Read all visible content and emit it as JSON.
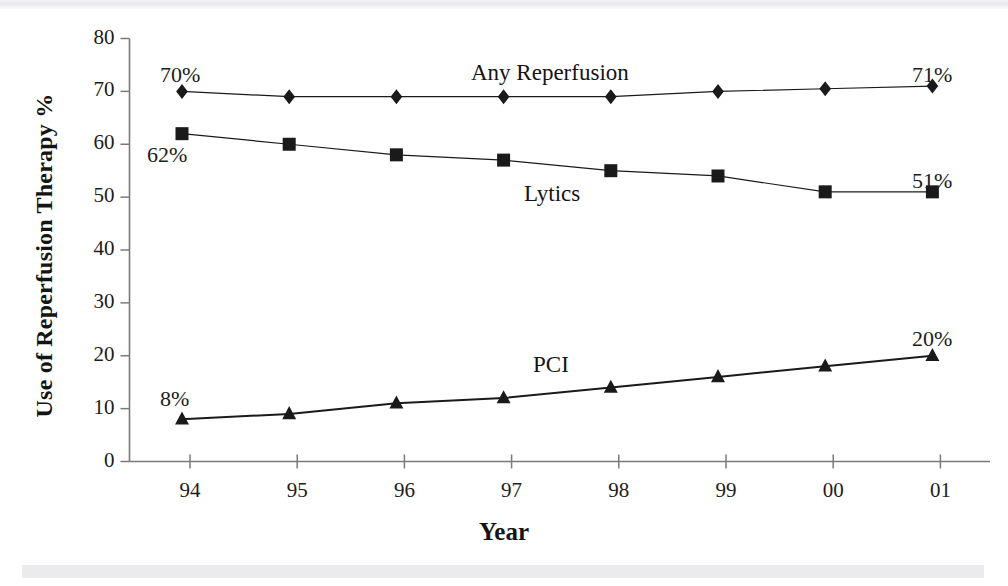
{
  "chart_data": {
    "type": "line",
    "title": "",
    "xlabel": "Year",
    "ylabel": "Use of Reperfusion Therapy %",
    "categories": [
      "94",
      "95",
      "96",
      "97",
      "98",
      "99",
      "00",
      "01"
    ],
    "ylim": [
      0,
      80
    ],
    "xlim_ticks": [
      "94",
      "95",
      "96",
      "97",
      "98",
      "99",
      "00",
      "01"
    ],
    "ytick_labels": [
      "80",
      "70",
      "60",
      "50",
      "40",
      "30",
      "20",
      "10",
      "0"
    ],
    "ytick_values": [
      80,
      70,
      60,
      50,
      40,
      30,
      20,
      10,
      0
    ],
    "grid": false,
    "legend_position": "inline-on-plot",
    "series": [
      {
        "name": "Any Reperfusion",
        "marker": "diamond",
        "values": [
          70,
          69,
          69,
          69,
          69,
          70,
          70.5,
          71
        ],
        "label_text": "Any Reperfusion"
      },
      {
        "name": "Lytics",
        "marker": "square",
        "values": [
          62,
          60,
          58,
          57,
          55,
          54,
          51,
          51
        ],
        "label_text": "Lytics"
      },
      {
        "name": "PCI",
        "marker": "triangle",
        "values": [
          8,
          9,
          11,
          12,
          14,
          16,
          18,
          20
        ],
        "label_text": "PCI"
      }
    ],
    "annotations": [
      {
        "text": "70%",
        "series": "Any Reperfusion",
        "point": "94"
      },
      {
        "text": "71%",
        "series": "Any Reperfusion",
        "point": "01"
      },
      {
        "text": "62%",
        "series": "Lytics",
        "point": "94"
      },
      {
        "text": "51%",
        "series": "Lytics",
        "point": "01"
      },
      {
        "text": "8%",
        "series": "PCI",
        "point": "94"
      },
      {
        "text": "20%",
        "series": "PCI",
        "point": "01"
      }
    ],
    "colors": {
      "axis": "#6b6b6b",
      "text": "#141414",
      "any_reperfusion": "#1a1a1a",
      "lytics": "#1a1a1a",
      "pci": "#1a1a1a",
      "background": "#ffffff"
    }
  },
  "axes": {
    "y_title": "Use of Reperfusion Therapy %",
    "x_title": "Year",
    "y_ticks": [
      {
        "label": "80"
      },
      {
        "label": "70"
      },
      {
        "label": "60"
      },
      {
        "label": "50"
      },
      {
        "label": "40"
      },
      {
        "label": "30"
      },
      {
        "label": "20"
      },
      {
        "label": "10"
      },
      {
        "label": "0"
      }
    ],
    "x_ticks": [
      {
        "label": "94"
      },
      {
        "label": "95"
      },
      {
        "label": "96"
      },
      {
        "label": "97"
      },
      {
        "label": "98"
      },
      {
        "label": "99"
      },
      {
        "label": "00"
      },
      {
        "label": "01"
      }
    ]
  },
  "labels": {
    "any_reperfusion": "Any Reperfusion",
    "lytics": "Lytics",
    "pci": "PCI",
    "ann_70": "70%",
    "ann_71": "71%",
    "ann_62": "62%",
    "ann_51": "51%",
    "ann_8": "8%",
    "ann_20": "20%"
  }
}
